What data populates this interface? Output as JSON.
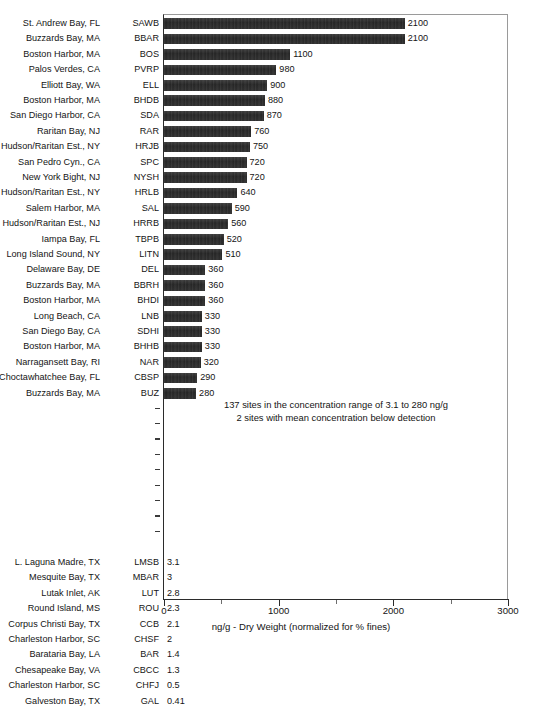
{
  "chart_data": {
    "type": "bar",
    "orientation": "horizontal",
    "title": "",
    "xlabel": "ng/g - Dry Weight (normalized for % fines)",
    "ylabel": "",
    "xlim": [
      0,
      3000
    ],
    "xticks": [
      0,
      500,
      1000,
      1500,
      2000,
      2500,
      3000
    ],
    "xtick_labels": [
      "0",
      "",
      "1000",
      "",
      "2000",
      "",
      "3000"
    ],
    "grid": false,
    "legend": null,
    "units": "ng/g",
    "annotations": [
      "137 sites in the concentration range of 3.1 to 280 ng/g",
      "2 sites with mean concentration below detection"
    ],
    "gap_row_count": 9,
    "categories": [
      "SAWB",
      "BBAR",
      "BOS",
      "PVRP",
      "ELL",
      "BHDB",
      "SDA",
      "RAR",
      "HRJB",
      "SPC",
      "NYSH",
      "HRLB",
      "SAL",
      "HRRB",
      "TBPB",
      "LITN",
      "DEL",
      "BBRH",
      "BHDI",
      "LNB",
      "SDHI",
      "BHHB",
      "NAR",
      "CBSP",
      "BUZ",
      "LMSB",
      "MBAR",
      "LUT",
      "ROU",
      "CCB",
      "CHSF",
      "BAR",
      "CBCC",
      "CHFJ",
      "GAL"
    ],
    "values": [
      2100,
      2100,
      1100,
      980,
      900,
      880,
      870,
      760,
      750,
      720,
      720,
      640,
      590,
      560,
      520,
      510,
      360,
      360,
      360,
      330,
      330,
      330,
      320,
      290,
      280,
      3.1,
      3,
      2.8,
      2.3,
      2.1,
      2,
      1.4,
      1.3,
      0.5,
      0.41
    ],
    "rows": [
      {
        "site": "St. Andrew Bay, FL",
        "code": "SAWB",
        "value": 2100,
        "label": "2100"
      },
      {
        "site": "Buzzards Bay, MA",
        "code": "BBAR",
        "value": 2100,
        "label": "2100"
      },
      {
        "site": "Boston Harbor, MA",
        "code": "BOS",
        "value": 1100,
        "label": "1100"
      },
      {
        "site": "Palos Verdes, CA",
        "code": "PVRP",
        "value": 980,
        "label": "980"
      },
      {
        "site": "Elliott Bay, WA",
        "code": "ELL",
        "value": 900,
        "label": "900"
      },
      {
        "site": "Boston Harbor, MA",
        "code": "BHDB",
        "value": 880,
        "label": "880"
      },
      {
        "site": "San Diego Harbor, CA",
        "code": "SDA",
        "value": 870,
        "label": "870"
      },
      {
        "site": "Raritan Bay, NJ",
        "code": "RAR",
        "value": 760,
        "label": "760"
      },
      {
        "site": "Hudson/Raritan Est., NY",
        "code": "HRJB",
        "value": 750,
        "label": "750"
      },
      {
        "site": "San Pedro Cyn., CA",
        "code": "SPC",
        "value": 720,
        "label": "720"
      },
      {
        "site": "New York Bight, NJ",
        "code": "NYSH",
        "value": 720,
        "label": "720"
      },
      {
        "site": "Hudson/Raritan Est., NY",
        "code": "HRLB",
        "value": 640,
        "label": "640"
      },
      {
        "site": "Salem Harbor, MA",
        "code": "SAL",
        "value": 590,
        "label": "590"
      },
      {
        "site": "Hudson/Raritan Est., NJ",
        "code": "HRRB",
        "value": 560,
        "label": "560"
      },
      {
        "site": "Iampa Bay, FL",
        "code": "TBPB",
        "value": 520,
        "label": "520"
      },
      {
        "site": "Long Island Sound, NY",
        "code": "LITN",
        "value": 510,
        "label": "510"
      },
      {
        "site": "Delaware Bay, DE",
        "code": "DEL",
        "value": 360,
        "label": "360"
      },
      {
        "site": "Buzzards Bay, MA",
        "code": "BBRH",
        "value": 360,
        "label": "360"
      },
      {
        "site": "Boston Harbor, MA",
        "code": "BHDI",
        "value": 360,
        "label": "360"
      },
      {
        "site": "Long Beach, CA",
        "code": "LNB",
        "value": 330,
        "label": "330"
      },
      {
        "site": "San Diego Bay, CA",
        "code": "SDHI",
        "value": 330,
        "label": "330"
      },
      {
        "site": "Boston Harbor, MA",
        "code": "BHHB",
        "value": 330,
        "label": "330"
      },
      {
        "site": "Narragansett Bay, RI",
        "code": "NAR",
        "value": 320,
        "label": "320"
      },
      {
        "site": "Choctawhatchee Bay, FL",
        "code": "CBSP",
        "value": 290,
        "label": "290"
      },
      {
        "site": "Buzzards Bay, MA",
        "code": "BUZ",
        "value": 280,
        "label": "280"
      },
      {
        "site": "L. Laguna Madre, TX",
        "code": "LMSB",
        "value": 3.1,
        "label": "3.1"
      },
      {
        "site": "Mesquite Bay, TX",
        "code": "MBAR",
        "value": 3,
        "label": "3"
      },
      {
        "site": "Lutak Inlet, AK",
        "code": "LUT",
        "value": 2.8,
        "label": "2.8"
      },
      {
        "site": "Round Island, MS",
        "code": "ROU",
        "value": 2.3,
        "label": "2.3"
      },
      {
        "site": "Corpus Christi Bay, TX",
        "code": "CCB",
        "value": 2.1,
        "label": "2.1"
      },
      {
        "site": "Charleston Harbor, SC",
        "code": "CHSF",
        "value": 2,
        "label": "2"
      },
      {
        "site": "Barataria Bay, LA",
        "code": "BAR",
        "value": 1.4,
        "label": "1.4"
      },
      {
        "site": "Chesapeake Bay, VA",
        "code": "CBCC",
        "value": 1.3,
        "label": "1.3"
      },
      {
        "site": "Charleston Harbor, SC",
        "code": "CHFJ",
        "value": 0.5,
        "label": "0.5"
      },
      {
        "site": "Galveston Bay, TX",
        "code": "GAL",
        "value": 0.41,
        "label": "0.41"
      }
    ],
    "colors": {
      "bar": "#272727",
      "axis": "#2b2b2b",
      "frame": "#9a9a9a",
      "text": "#141414",
      "caption": "#9fa0a2"
    }
  },
  "caption": {
    "text": ""
  }
}
